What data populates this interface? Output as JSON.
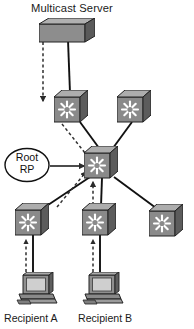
{
  "diagram": {
    "type": "network-topology",
    "labels": {
      "server": "Multicast Server",
      "rp_line1": "Root",
      "rp_line2": "RP",
      "recipient_a": "Recipient A",
      "recipient_b": "Recipient B"
    },
    "colors": {
      "device_face": "#8a8a8a",
      "device_top": "#a8a8a8",
      "device_side": "#5e5e5e",
      "device_outline": "#2b2b2b",
      "starburst": "#ffffff",
      "link_solid": "#111111",
      "link_dashed": "#3b3b3b",
      "text": "#1a1a1a",
      "screen": "#cfcfcf",
      "background": "#ffffff"
    },
    "nodes": [
      {
        "id": "server",
        "name": "multicast-server",
        "kind": "server",
        "x": 67,
        "y": 31
      },
      {
        "id": "switch-top-l",
        "name": "switch-top-left",
        "kind": "switch",
        "x": 71,
        "y": 106
      },
      {
        "id": "switch-top-r",
        "name": "switch-top-right",
        "kind": "switch",
        "x": 134,
        "y": 106
      },
      {
        "id": "switch-center",
        "name": "switch-center-root-rp",
        "kind": "switch",
        "x": 101,
        "y": 162
      },
      {
        "id": "switch-bot-l",
        "name": "switch-bottom-left",
        "kind": "switch",
        "x": 32,
        "y": 219
      },
      {
        "id": "switch-bot-m",
        "name": "switch-bottom-middle",
        "kind": "switch",
        "x": 99,
        "y": 219
      },
      {
        "id": "switch-bot-r",
        "name": "switch-bottom-right",
        "kind": "switch",
        "x": 166,
        "y": 220
      },
      {
        "id": "pc-a",
        "name": "recipient-a-workstation",
        "kind": "workstation",
        "x": 37,
        "y": 288
      },
      {
        "id": "pc-b",
        "name": "recipient-b-workstation",
        "kind": "workstation",
        "x": 103,
        "y": 288
      }
    ],
    "links": [
      {
        "from": "server",
        "to": "switch-top-l",
        "style": "solid"
      },
      {
        "from": "switch-top-l",
        "to": "switch-center",
        "style": "solid"
      },
      {
        "from": "switch-top-r",
        "to": "switch-center",
        "style": "solid"
      },
      {
        "from": "switch-center",
        "to": "switch-bot-l",
        "style": "solid"
      },
      {
        "from": "switch-center",
        "to": "switch-bot-m",
        "style": "solid"
      },
      {
        "from": "switch-center",
        "to": "switch-bot-r",
        "style": "solid"
      },
      {
        "from": "switch-bot-l",
        "to": "pc-a",
        "style": "solid"
      },
      {
        "from": "switch-bot-m",
        "to": "pc-b",
        "style": "solid"
      }
    ],
    "flows": [
      {
        "name": "flow-server-down",
        "style": "dashed",
        "direction": "down",
        "from": "server",
        "to": "switch-top-l"
      },
      {
        "name": "flow-topleft-to-center",
        "style": "dashed",
        "direction": "down",
        "from": "switch-top-l",
        "to": "switch-center"
      },
      {
        "name": "flow-botleft-to-center",
        "style": "dashed",
        "direction": "up",
        "from": "switch-bot-l",
        "to": "switch-center"
      },
      {
        "name": "flow-botmid-to-center",
        "style": "dashed",
        "direction": "up",
        "from": "switch-bot-m",
        "to": "switch-center"
      },
      {
        "name": "flow-pca-to-botleft",
        "style": "dashed",
        "direction": "up",
        "from": "pc-a",
        "to": "switch-bot-l"
      },
      {
        "name": "flow-pcb-to-botmid",
        "style": "dashed",
        "direction": "up",
        "from": "pc-b",
        "to": "switch-bot-m"
      }
    ],
    "callout": {
      "name": "root-rp-callout",
      "shape": "ellipse",
      "points_to": "switch-center"
    }
  }
}
